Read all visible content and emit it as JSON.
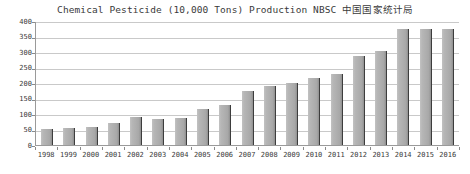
{
  "chart_data": {
    "type": "bar",
    "title": "Chemical Pesticide (10,000 Tons) Production NBSC 中国国家统计局",
    "xlabel": "",
    "ylabel": "",
    "ylim": [
      0,
      400
    ],
    "ytick_step": 50,
    "yticks": [
      "400",
      "350",
      "300",
      "250",
      "200",
      "150",
      "100",
      "50",
      "0"
    ],
    "grid": true,
    "legend": "none",
    "categories": [
      "1998",
      "1999",
      "2000",
      "2001",
      "2002",
      "2003",
      "2004",
      "2005",
      "2006",
      "2007",
      "2008",
      "2009",
      "2010",
      "2011",
      "2012",
      "2013",
      "2014",
      "2015",
      "2016"
    ],
    "values": [
      53,
      55,
      57,
      70,
      90,
      85,
      87,
      115,
      130,
      173,
      190,
      200,
      216,
      229,
      287,
      303,
      374,
      374,
      374
    ],
    "series": [
      {
        "name": "Chemical Pesticide Production",
        "values": [
          53,
          55,
          57,
          70,
          90,
          85,
          87,
          115,
          130,
          173,
          190,
          200,
          216,
          229,
          287,
          303,
          374,
          374,
          374
        ]
      }
    ],
    "colors": {
      "bar_fill": "#b0b0b0",
      "bar_edge": "#3d3d3d",
      "gridline": "#c9c9c9",
      "axis": "#9a9a9a",
      "text": "#3a3a3a",
      "background": "#ffffff"
    }
  }
}
